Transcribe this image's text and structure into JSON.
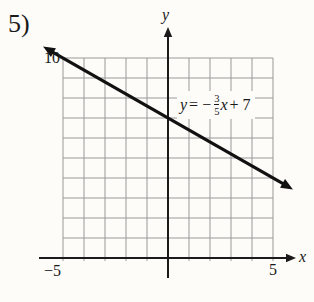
{
  "problem_label": "5)",
  "graph": {
    "y_axis_label": "y",
    "x_axis_label": "x",
    "y_top_tick": "10",
    "x_min_tick": "−5",
    "x_max_tick": "5"
  },
  "equation": {
    "lhs": "y",
    "rel": "= −",
    "numerator": "3",
    "denominator": "5",
    "variable": "x",
    "tail": "+ 7"
  },
  "colors": {
    "background": "#fdfcf9",
    "grid": "#999999",
    "axis": "#1a1a1a",
    "line": "#111111"
  },
  "chart_data": {
    "type": "line",
    "title": "",
    "equation_text": "y = -3/5x + 7",
    "x_range": [
      -5,
      5
    ],
    "y_range": [
      0,
      10
    ],
    "grid": true,
    "grid_step": 1,
    "legend": false,
    "series": [
      {
        "name": "y = -3/5x + 7",
        "slope": -0.6,
        "intercept": 7,
        "points": [
          [
            -5,
            10
          ],
          [
            0,
            7
          ],
          [
            5,
            4
          ]
        ]
      }
    ],
    "x_tick_labels": [
      -5,
      5
    ],
    "y_tick_labels": [
      10
    ]
  }
}
